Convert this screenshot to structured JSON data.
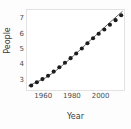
{
  "chart_data": {
    "type": "scatter",
    "title": "",
    "xlabel": "Year",
    "ylabel": "People",
    "xlim": [
      1948,
      2017
    ],
    "ylim": [
      2.25,
      7.6
    ],
    "grid": false,
    "legend": null,
    "xticks": [
      1960,
      1980,
      2000
    ],
    "xtick_labels": [
      "1960",
      "1980",
      "2000"
    ],
    "yticks": [
      3,
      4,
      5,
      6,
      7
    ],
    "ytick_labels": [
      "3",
      "4",
      "5",
      "6",
      "7"
    ],
    "marker_color": "#1c1c1c",
    "line_color": "#3c3c3c",
    "series": [
      {
        "name": "People",
        "x": [
          1951,
          1955,
          1959,
          1963,
          1967,
          1971,
          1975,
          1979,
          1983,
          1987,
          1991,
          1995,
          1999,
          2003,
          2007,
          2011,
          2015
        ],
        "values": [
          2.55,
          2.77,
          2.98,
          3.2,
          3.48,
          3.77,
          4.07,
          4.38,
          4.69,
          5.03,
          5.38,
          5.71,
          6.01,
          6.3,
          6.61,
          6.92,
          7.25
        ]
      }
    ],
    "fit_line": {
      "name": "smooth-fit",
      "x": [
        1949,
        1955,
        1961,
        1967,
        1973,
        1979,
        1985,
        1991,
        1997,
        2003,
        2009,
        2016
      ],
      "y": [
        2.52,
        2.78,
        3.06,
        3.43,
        3.88,
        4.36,
        4.87,
        5.4,
        5.91,
        6.43,
        6.94,
        7.52
      ]
    }
  },
  "axes": {
    "x_label": "Year",
    "y_label": "People"
  }
}
